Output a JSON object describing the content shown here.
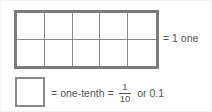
{
  "figure": {
    "name": "tenths-place-value-diagram",
    "colors": {
      "whole_border": "#7b7b7b",
      "grid_line": "#8a8a8a",
      "tenth_border": "#8a8a8a",
      "text": "#555555",
      "background": "#ffffff",
      "outer_border": "#f2f2f2"
    }
  },
  "whole": {
    "columns": 5,
    "rows": 2,
    "total_cells": 10,
    "label": "= 1 one"
  },
  "tenth": {
    "lead_equals": "=",
    "name": "one-tenth",
    "second_equals": "=",
    "fraction": {
      "numerator": "1",
      "denominator": "10"
    },
    "or_text": "or 0.1"
  }
}
